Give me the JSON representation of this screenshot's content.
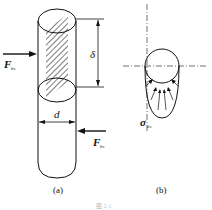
{
  "figure": {
    "panel_a": {
      "caption": "(a)",
      "labels": {
        "force_left": "F",
        "force_left_sub": "bs",
        "force_right": "F",
        "force_right_sub": "bs",
        "height": "δ",
        "diameter": "d"
      }
    },
    "panel_b": {
      "caption": "(b)",
      "labels": {
        "stress": "σ",
        "stress_sub": "bs"
      }
    },
    "figure_caption": "图 2-1",
    "colors": {
      "line": "#111111",
      "background": "#ffffff"
    }
  }
}
